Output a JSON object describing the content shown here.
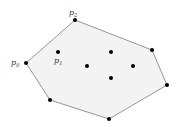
{
  "diagram": {
    "colors": {
      "hull_fill": "#f3f3f3",
      "hull_edge": "#8a8a8a",
      "point": "#000000",
      "label": "#333333"
    },
    "hull_order": [
      "p0",
      "p2",
      "h3",
      "h4",
      "h5",
      "h6"
    ],
    "points": [
      {
        "id": "p0",
        "label_base": "p",
        "label_sub": "0",
        "on_hull": true
      },
      {
        "id": "p1",
        "label_base": "p",
        "label_sub": "1",
        "on_hull": false
      },
      {
        "id": "p2",
        "label_base": "p",
        "label_sub": "2",
        "on_hull": true
      },
      {
        "id": "h3",
        "label_base": "",
        "label_sub": "",
        "on_hull": true
      },
      {
        "id": "h4",
        "label_base": "",
        "label_sub": "",
        "on_hull": true
      },
      {
        "id": "h5",
        "label_base": "",
        "label_sub": "",
        "on_hull": true
      },
      {
        "id": "h6",
        "label_base": "",
        "label_sub": "",
        "on_hull": true
      },
      {
        "id": "i1",
        "label_base": "",
        "label_sub": "",
        "on_hull": false
      },
      {
        "id": "i2",
        "label_base": "",
        "label_sub": "",
        "on_hull": false
      },
      {
        "id": "i3",
        "label_base": "",
        "label_sub": "",
        "on_hull": false
      },
      {
        "id": "i4",
        "label_base": "",
        "label_sub": "",
        "on_hull": false
      }
    ]
  }
}
